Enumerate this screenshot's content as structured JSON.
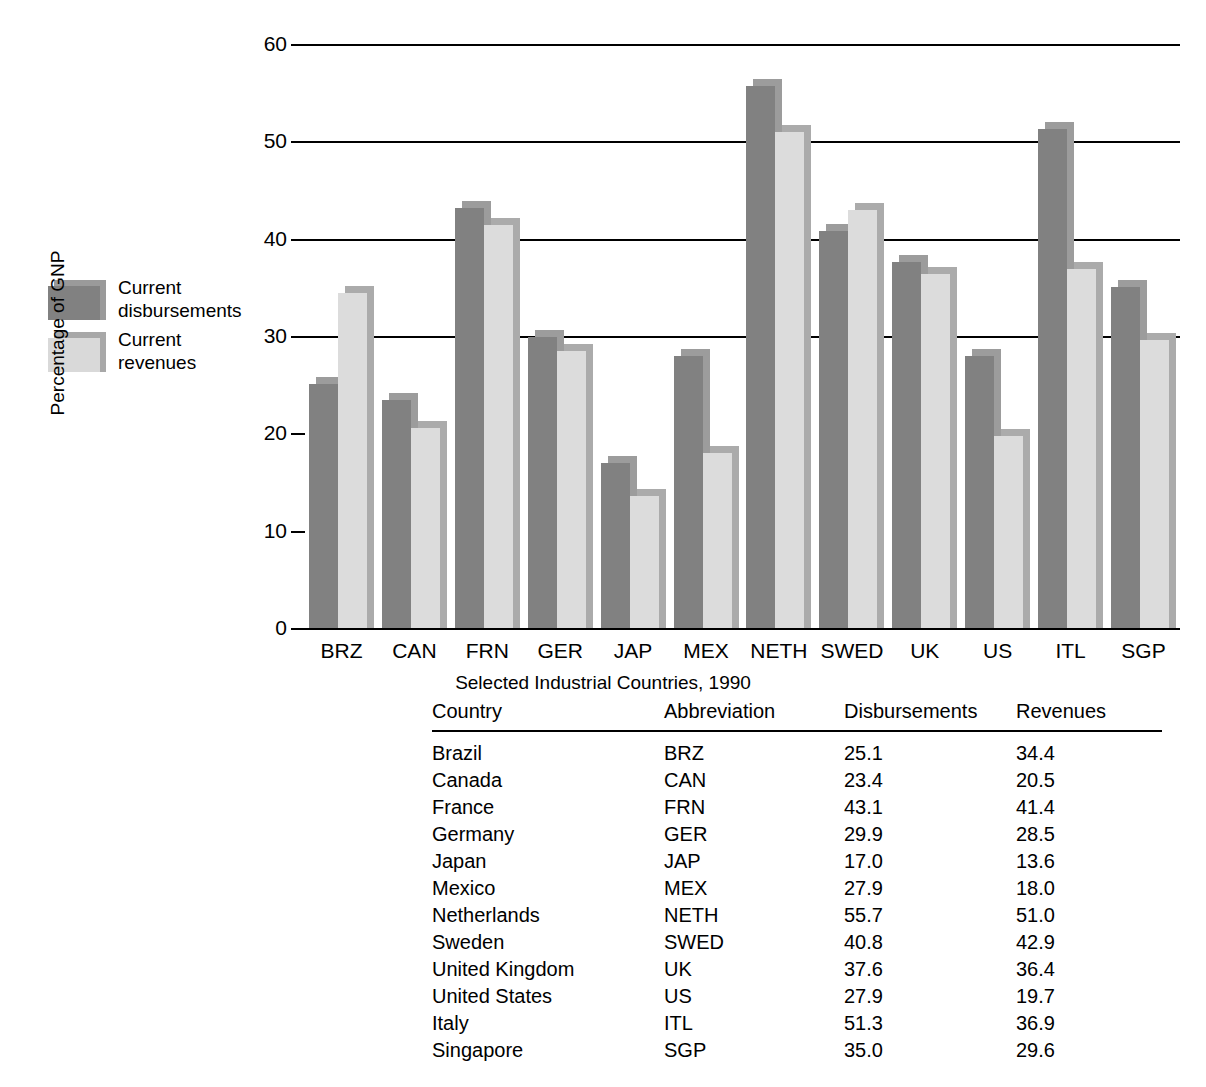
{
  "chart_data": {
    "type": "bar",
    "title": "",
    "xlabel": "Selected Industrial Countries, 1990",
    "ylabel": "Percentage of GNP",
    "ylim": [
      0,
      60
    ],
    "yticks": [
      0,
      10,
      20,
      30,
      40,
      50,
      60
    ],
    "grid": true,
    "legend_position": "left-outside",
    "categories": [
      "BRZ",
      "CAN",
      "FRN",
      "GER",
      "JAP",
      "MEX",
      "NETH",
      "SWED",
      "UK",
      "US",
      "ITL",
      "SGP"
    ],
    "series": [
      {
        "name": "Current disbursements",
        "color": "#818181",
        "values": [
          25.1,
          23.4,
          43.1,
          29.9,
          17.0,
          27.9,
          55.7,
          40.8,
          37.6,
          27.9,
          51.3,
          35.0
        ]
      },
      {
        "name": "Current revenues",
        "color": "#dcdcdc",
        "values": [
          34.4,
          20.5,
          41.4,
          28.5,
          13.6,
          18.0,
          51.0,
          42.9,
          36.4,
          19.7,
          36.9,
          29.6
        ]
      }
    ]
  },
  "legend": {
    "items": [
      {
        "label": "Current\ndisbursements",
        "swatch": "dark"
      },
      {
        "label": "Current\nrevenues",
        "swatch": "light"
      }
    ]
  },
  "axes": {
    "y_title": "Percentage of GNP",
    "x_title": "Selected Industrial Countries, 1990",
    "y_tick_labels": [
      "60",
      "50",
      "40",
      "30",
      "20",
      "10",
      "0"
    ],
    "x_tick_labels": [
      "BRZ",
      "CAN",
      "FRN",
      "GER",
      "JAP",
      "MEX",
      "NETH",
      "SWED",
      "UK",
      "US",
      "ITL",
      "SGP"
    ]
  },
  "table": {
    "headers": [
      "Country",
      "Abbreviation",
      "Disbursements",
      "Revenues"
    ],
    "rows": [
      {
        "country": "Brazil",
        "abbr": "BRZ",
        "disbursements": "25.1",
        "revenues": "34.4"
      },
      {
        "country": "Canada",
        "abbr": "CAN",
        "disbursements": "23.4",
        "revenues": "20.5"
      },
      {
        "country": "France",
        "abbr": "FRN",
        "disbursements": "43.1",
        "revenues": "41.4"
      },
      {
        "country": "Germany",
        "abbr": "GER",
        "disbursements": "29.9",
        "revenues": "28.5"
      },
      {
        "country": "Japan",
        "abbr": "JAP",
        "disbursements": "17.0",
        "revenues": "13.6"
      },
      {
        "country": "Mexico",
        "abbr": "MEX",
        "disbursements": "27.9",
        "revenues": "18.0"
      },
      {
        "country": "Netherlands",
        "abbr": "NETH",
        "disbursements": "55.7",
        "revenues": "51.0"
      },
      {
        "country": "Sweden",
        "abbr": "SWED",
        "disbursements": "40.8",
        "revenues": "42.9"
      },
      {
        "country": "United Kingdom",
        "abbr": "UK",
        "disbursements": "37.6",
        "revenues": "36.4"
      },
      {
        "country": "United States",
        "abbr": "US",
        "disbursements": "27.9",
        "revenues": "19.7"
      },
      {
        "country": "Italy",
        "abbr": "ITL",
        "disbursements": "51.3",
        "revenues": "36.9"
      },
      {
        "country": "Singapore",
        "abbr": "SGP",
        "disbursements": "35.0",
        "revenues": "29.6"
      }
    ]
  },
  "colors": {
    "disbursements": "#818181",
    "revenues": "#dcdcdc",
    "axis": "#000000",
    "background": "#ffffff"
  }
}
